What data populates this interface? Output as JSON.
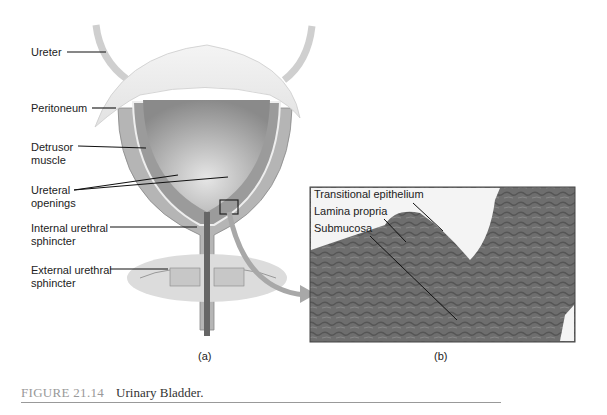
{
  "figure": {
    "number": "FIGURE 21.14",
    "title": "Urinary Bladder."
  },
  "panel_a": {
    "sublabel": "(a)",
    "labels": [
      {
        "id": "ureter",
        "text": "Ureter"
      },
      {
        "id": "peritoneum",
        "text": "Peritoneum"
      },
      {
        "id": "detrusor",
        "text": "Detrusor\nmuscle"
      },
      {
        "id": "ureteral-openings",
        "text": "Ureteral\nopenings"
      },
      {
        "id": "internal-sphincter",
        "text": "Internal urethral\nsphincter"
      },
      {
        "id": "external-sphincter",
        "text": "External urethral\nsphincter"
      }
    ]
  },
  "panel_b": {
    "sublabel": "(b)",
    "labels": [
      {
        "id": "transitional-epithelium",
        "text": "Transitional epithelium"
      },
      {
        "id": "lamina-propria",
        "text": "Lamina propria"
      },
      {
        "id": "submucosa",
        "text": "Submucosa"
      }
    ]
  }
}
